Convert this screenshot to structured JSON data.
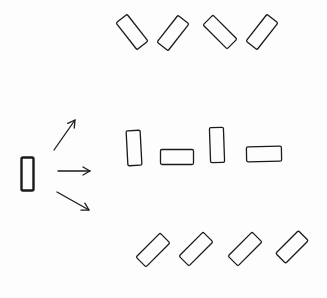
{
  "diagram": {
    "colors": {
      "stroke": "#1a1a1a",
      "background": "#fdfdfd"
    },
    "source_block": {
      "cx": 27.5,
      "cy": 174,
      "w": 12,
      "h": 33,
      "angle": 0,
      "thick": true
    },
    "arrows": [
      {
        "name": "arrow-up",
        "x1": 54,
        "y1": 150,
        "x2": 75,
        "y2": 120
      },
      {
        "name": "arrow-middle",
        "x1": 58,
        "y1": 171,
        "x2": 90,
        "y2": 171
      },
      {
        "name": "arrow-down",
        "x1": 57,
        "y1": 192,
        "x2": 89,
        "y2": 210
      }
    ],
    "rows": [
      {
        "name": "top-row",
        "shapes": [
          {
            "cx": 132,
            "cy": 32,
            "w": 14,
            "h": 34,
            "angle": -38
          },
          {
            "cx": 173,
            "cy": 33,
            "w": 14,
            "h": 34,
            "angle": 38
          },
          {
            "cx": 220,
            "cy": 32,
            "w": 14,
            "h": 34,
            "angle": -45
          },
          {
            "cx": 262,
            "cy": 32,
            "w": 14,
            "h": 34,
            "angle": 38
          }
        ]
      },
      {
        "name": "middle-row",
        "shapes": [
          {
            "cx": 134,
            "cy": 148,
            "w": 14,
            "h": 35,
            "angle": -3
          },
          {
            "cx": 177,
            "cy": 157,
            "w": 33,
            "h": 15,
            "angle": 0
          },
          {
            "cx": 217,
            "cy": 145,
            "w": 14,
            "h": 35,
            "angle": -2
          },
          {
            "cx": 264,
            "cy": 154,
            "w": 35,
            "h": 15,
            "angle": -1
          }
        ]
      },
      {
        "name": "bottom-row",
        "shapes": [
          {
            "cx": 153,
            "cy": 250,
            "w": 14,
            "h": 34,
            "angle": 45
          },
          {
            "cx": 196,
            "cy": 249,
            "w": 14,
            "h": 34,
            "angle": 45
          },
          {
            "cx": 245,
            "cy": 249,
            "w": 14,
            "h": 34,
            "angle": 45
          },
          {
            "cx": 292,
            "cy": 247,
            "w": 14,
            "h": 32,
            "angle": 45
          }
        ]
      }
    ]
  }
}
